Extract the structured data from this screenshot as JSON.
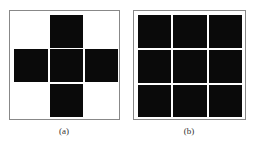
{
  "figures": [
    {
      "caption": "(a)",
      "pattern": "cross",
      "grid": [
        [
          0,
          1,
          0
        ],
        [
          1,
          1,
          1
        ],
        [
          0,
          1,
          0
        ]
      ]
    },
    {
      "caption": "(b)",
      "pattern": "full",
      "grid": [
        [
          1,
          1,
          1
        ],
        [
          1,
          1,
          1
        ],
        [
          1,
          1,
          1
        ]
      ]
    }
  ],
  "colors": {
    "cell": "#0a0a0a",
    "frame": "#888888",
    "background": "#ffffff"
  }
}
